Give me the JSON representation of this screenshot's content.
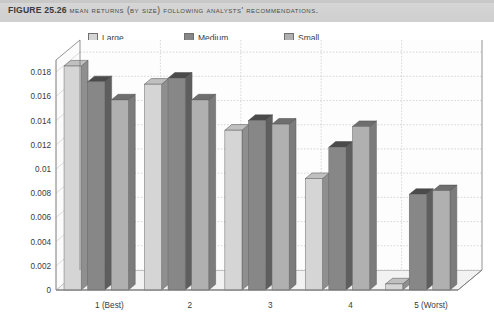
{
  "header": {
    "figure_number": "FIGURE 25.26",
    "caption": "Mean returns (by size) following analysts' recommendations."
  },
  "legend": {
    "position": "top",
    "entries": [
      {
        "label": "Large",
        "color": "#d5d5d5"
      },
      {
        "label": "Medium",
        "color": "#878787"
      },
      {
        "label": "Small",
        "color": "#b0b0b0"
      }
    ]
  },
  "axis": {
    "y_ticks": [
      "0.018",
      "0.016",
      "0.014",
      "0.012",
      "0.01",
      "0.008",
      "0.006",
      "0.004",
      "0.002",
      "0"
    ],
    "x_ticks": [
      "1 (Best)",
      "2",
      "3",
      "4",
      "5 (Worst)"
    ]
  },
  "chart_data": {
    "type": "bar",
    "title": "Mean returns (by size) following analysts' recommendations.",
    "xlabel": "",
    "ylabel": "",
    "ylim": [
      0,
      0.019
    ],
    "ytick_values": [
      0,
      0.002,
      0.004,
      0.006,
      0.008,
      0.01,
      0.012,
      0.014,
      0.016,
      0.018
    ],
    "grid": true,
    "three_d": true,
    "legend_position": "top",
    "categories": [
      "1 (Best)",
      "2",
      "3",
      "4",
      "5 (Worst)"
    ],
    "series": [
      {
        "name": "Large",
        "color": "#d5d5d5",
        "values": [
          0.0185,
          0.017,
          0.0132,
          0.0092,
          0.0005
        ]
      },
      {
        "name": "Medium",
        "color": "#878787",
        "values": [
          0.0172,
          0.0175,
          0.014,
          0.0118,
          0.0079
        ]
      },
      {
        "name": "Small",
        "color": "#b0b0b0",
        "values": [
          0.0157,
          0.0157,
          0.0137,
          0.0135,
          0.0082
        ]
      }
    ]
  },
  "colors": {
    "large_face": "#d5d5d5",
    "medium_face": "#878787",
    "small_face": "#b0b0b0",
    "large_side": "#8f8f8f",
    "medium_side": "#5e5e5e",
    "small_side": "#7c7c7c",
    "large_top": "#c0c0c0",
    "medium_top": "#4a4a4a",
    "small_top": "#6e6e6e",
    "grid": "#c9c9c9",
    "axis": "#7a7a7a",
    "floor": "#f2f2f2",
    "back_wall": "#fdfdfd",
    "header_bg": "#d4d4d4"
  }
}
